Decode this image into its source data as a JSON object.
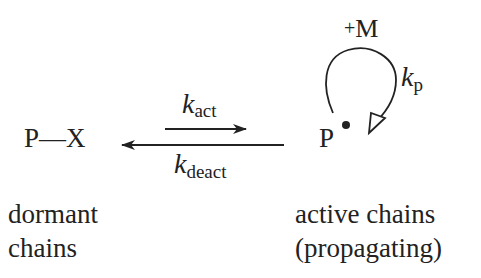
{
  "diagram": {
    "type": "reaction-equilibrium",
    "dormant_species": "P—X",
    "active_species": "P",
    "active_radical_marker": "•",
    "monomer_label": "+M",
    "forward_rate": {
      "k": "k",
      "subscript": "act"
    },
    "reverse_rate": {
      "k": "k",
      "subscript": "deact"
    },
    "propagation_rate": {
      "k": "k",
      "subscript": "p"
    },
    "captions": {
      "dormant": [
        "dormant",
        "chains"
      ],
      "active": [
        "active chains",
        "(propagating)"
      ]
    },
    "colors": {
      "ink": "#222222",
      "background": "#ffffff"
    }
  }
}
